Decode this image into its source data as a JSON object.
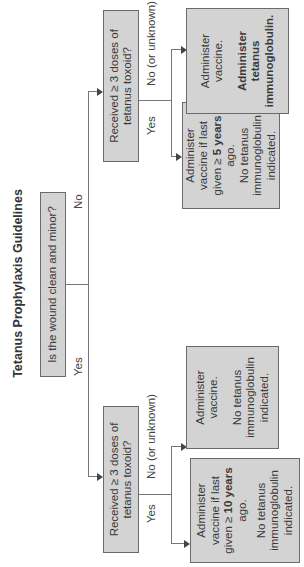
{
  "title": "Tetanus Prophylaxis Guidelines",
  "root": {
    "question": "Is the wound clean and minor?",
    "yes_label": "Yes",
    "no_label": "No"
  },
  "left_branch": {
    "question": "Received ≥ 3 doses of tetanus toxoid?",
    "yes_label": "Yes",
    "no_label": "No (or unknown)",
    "yes_outcome": {
      "line1": "Administer vaccine if last given ≥",
      "line1_bold": "10 years",
      "line1_end": "ago.",
      "line2": "No tetanus immunoglobulin indicated."
    },
    "no_outcome": {
      "line1": "Administer vaccine.",
      "line2": "No tetanus immunoglobulin indicated."
    }
  },
  "right_branch": {
    "question": "Received ≥ 3 doses of tetanus toxoid?",
    "yes_label": "Yes",
    "no_label": "No (or unknown)",
    "yes_outcome": {
      "line1": "Administer vaccine if last given ≥",
      "line1_bold": "5 years",
      "line1_end": "ago.",
      "line2": "No tetanus immunoglobulin indicated."
    },
    "no_outcome": {
      "line1": "Administer vaccine.",
      "line2_bold": "Administer tetanus immunoglobulin."
    }
  },
  "colors": {
    "box_fill": "#d3d3d3",
    "box_border": "#6b6b6b",
    "line": "#777777"
  }
}
